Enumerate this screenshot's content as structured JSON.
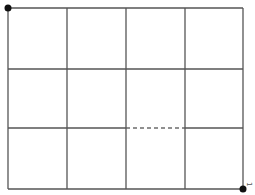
{
  "diagram": {
    "type": "grid",
    "columns": 4,
    "rows": 3,
    "origin": {
      "x": 8,
      "y": 8
    },
    "col_x": [
      8,
      67,
      126,
      185,
      243
    ],
    "row_y": [
      8,
      69,
      128,
      189
    ],
    "line_color": "#555555",
    "start_point": {
      "x": 8,
      "y": 8,
      "color": "#111111"
    },
    "end_point": {
      "x": 243,
      "y": 189,
      "color": "#111111",
      "label": "1"
    },
    "dashed_segment": {
      "from_col": 2,
      "to_col": 3,
      "row": 2
    }
  }
}
